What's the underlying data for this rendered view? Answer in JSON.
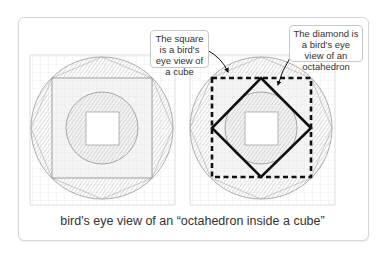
{
  "figure": {
    "callouts": [
      {
        "id": "square",
        "text": "The square is a bird's eye view of a cube"
      },
      {
        "id": "diamond",
        "text": "The diamond is a bird's eye view of an octahedron"
      }
    ],
    "caption": "bird's eye view of an “octahedron inside a cube”",
    "panels": [
      {
        "name": "left-sketch",
        "shapes": [
          "circle",
          "square",
          "inner-circle",
          "inner-square",
          "shaded-corners"
        ]
      },
      {
        "name": "right-sketch",
        "shapes": [
          "circle",
          "dashed-square",
          "diamond",
          "inner-circle",
          "inner-square"
        ]
      }
    ],
    "colors": {
      "outline": "#111111",
      "pencil": "#9a9a9a",
      "shade": "#cfcfcf"
    }
  }
}
